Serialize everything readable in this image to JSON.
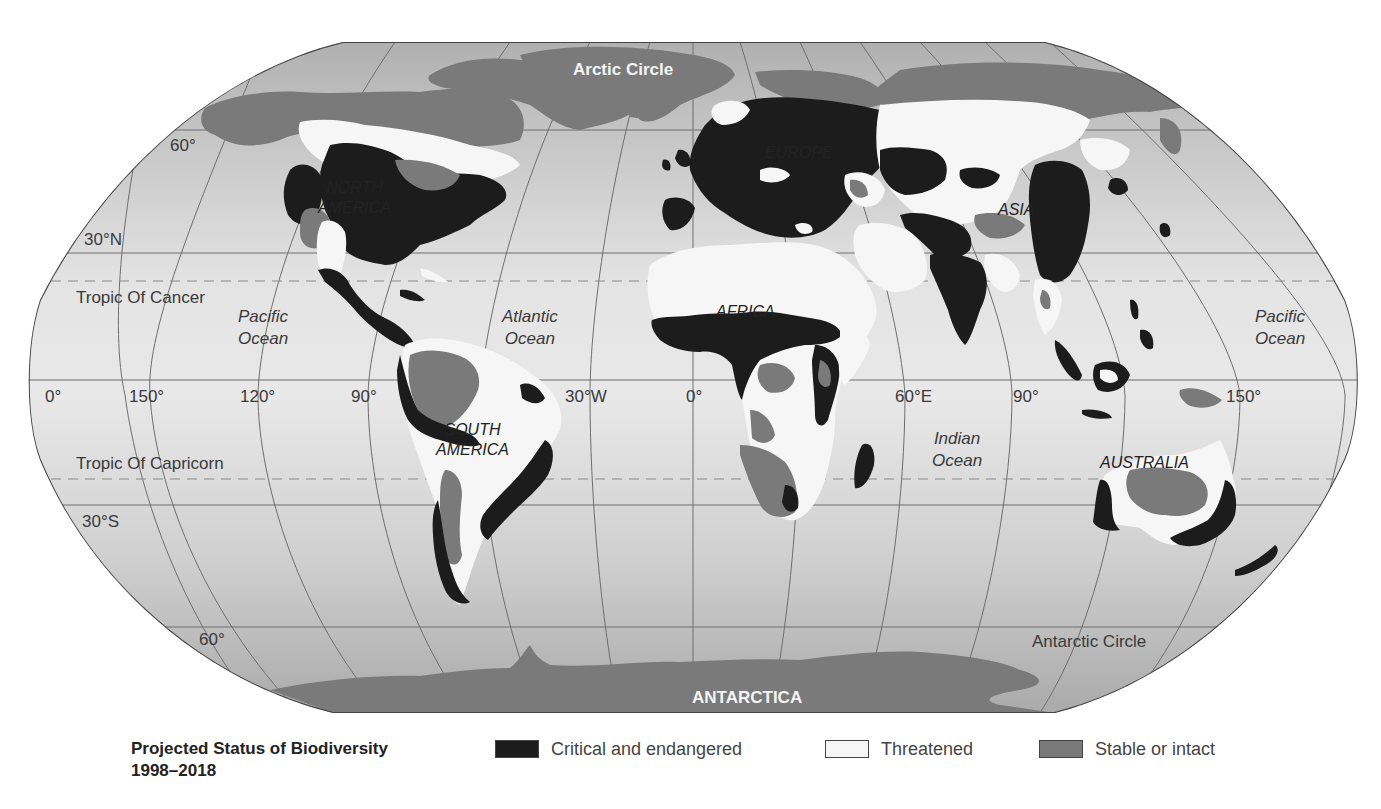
{
  "map": {
    "title": "Projected Status of Biodiversity",
    "subtitle": "1998–2018",
    "projection": "Robinson",
    "labels": {
      "arctic_circle": "Arctic Circle",
      "antarctic_circle": "Antarctic Circle",
      "antarctica": "ANTARCTICA",
      "tropic_cancer": "Tropic Of Cancer",
      "tropic_capricorn": "Tropic Of Capricorn"
    },
    "latitudes": {
      "lat60n": "60°",
      "lat30n": "30°N",
      "lat30s": "30°S",
      "lat60s": "60°"
    },
    "longitudes": {
      "lon0_left": "0°",
      "lon150w": "150°",
      "lon120w": "120°",
      "lon90w": "90°",
      "lon30w": "30°W",
      "lon0": "0°",
      "lon60e": "60°E",
      "lon90e": "90°",
      "lon150e": "150°"
    },
    "oceans": {
      "pacific_left_1": "Pacific",
      "pacific_left_2": "Ocean",
      "atlantic_1": "Atlantic",
      "atlantic_2": "Ocean",
      "indian_1": "Indian",
      "indian_2": "Ocean",
      "pacific_right_1": "Pacific",
      "pacific_right_2": "Ocean"
    },
    "continents": {
      "north_america_1": "NORTH",
      "north_america_2": "AMERICA",
      "south_america_1": "SOUTH",
      "south_america_2": "AMERICA",
      "europe": "EUROPE",
      "africa": "AFRICA",
      "asia": "ASIA",
      "australia": "AUSTRALIA"
    }
  },
  "legend": {
    "title": "Projected Status of Biodiversity",
    "years": "1998–2018",
    "items": [
      {
        "label": "Critical and endangered",
        "color": "#1c1c1c"
      },
      {
        "label": "Threatened",
        "color": "#f6f6f6"
      },
      {
        "label": "Stable or intact",
        "color": "#7a7a7a"
      }
    ]
  },
  "colors": {
    "ocean_polar": "#a9a9a9",
    "ocean_mid": "#d4d4d4",
    "ocean_equator": "#e6e6e6",
    "polar_land": "#7a7a7a",
    "critical": "#1c1c1c",
    "threatened": "#f6f6f6",
    "stable": "#7a7a7a",
    "grid": "#6e6e6e"
  }
}
